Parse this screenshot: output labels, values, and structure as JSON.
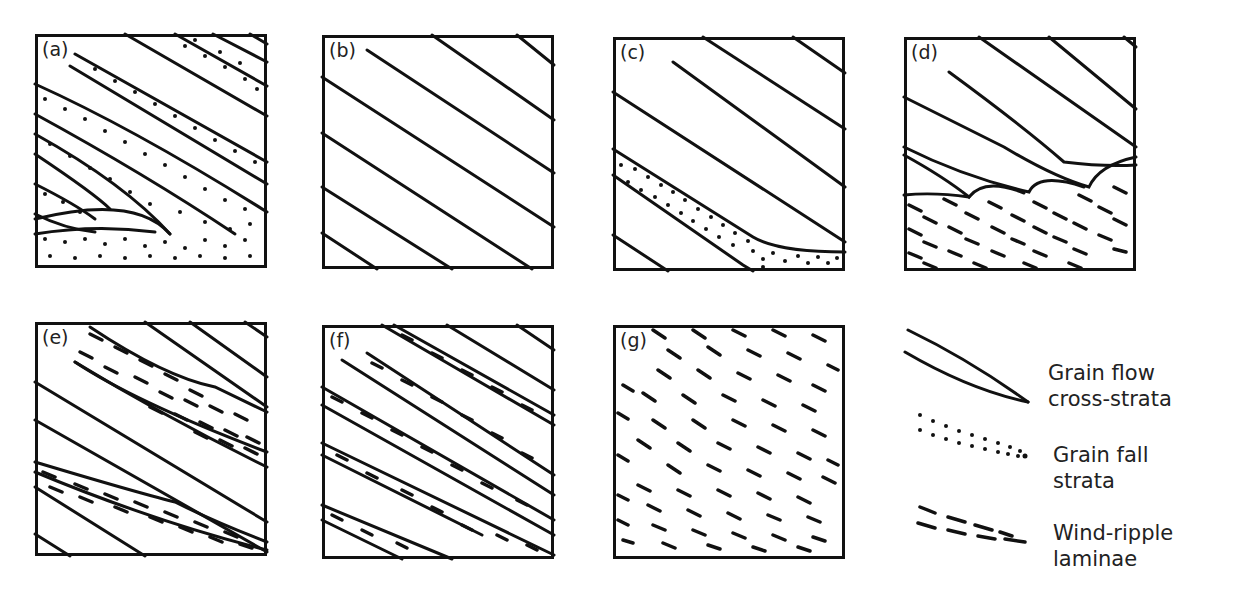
{
  "figure": {
    "panels": [
      {
        "id": "a",
        "label": "(a)",
        "description": "Grain flow cross-strata alternating with grain fall strata; grain fall at toesets"
      },
      {
        "id": "b",
        "label": "(b)",
        "description": "Grain flow cross-strata only"
      },
      {
        "id": "c",
        "label": "(c)",
        "description": "Grain flow cross-strata with single grain fall layer tangential at base"
      },
      {
        "id": "d",
        "label": "(d)",
        "description": "Grain flow cross-strata tonguing over wind-ripple laminae"
      },
      {
        "id": "e",
        "label": "(e)",
        "description": "Grain flow cross-strata with interbedded wedges of wind-ripple laminae"
      },
      {
        "id": "f",
        "label": "(f)",
        "description": "Grain flow cross-strata with thin wind-ripple laminae bands"
      },
      {
        "id": "g",
        "label": "(g)",
        "description": "Wind-ripple laminae only"
      }
    ],
    "legend": [
      {
        "id": "grain-flow",
        "label_line1": "Grain flow",
        "label_line2": "cross-strata",
        "symbol": "solid tapered lines"
      },
      {
        "id": "grain-fall",
        "label_line1": "Grain fall",
        "label_line2": "strata",
        "symbol": "dotted lines"
      },
      {
        "id": "wind-ripple",
        "label_line1": "Wind-ripple",
        "label_line2": "laminae",
        "symbol": "dashed lines"
      }
    ],
    "colors": {
      "ink": "#111111",
      "background": "#ffffff"
    }
  }
}
